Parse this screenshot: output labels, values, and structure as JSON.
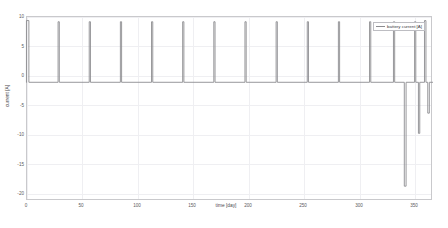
{
  "chart_data": {
    "type": "line",
    "title": "",
    "xlabel": "time [day]",
    "ylabel": "current [A]",
    "xlim": [
      0,
      365
    ],
    "ylim": [
      -20,
      11
    ],
    "xticks": [
      0,
      50,
      100,
      150,
      200,
      250,
      300,
      350
    ],
    "xticklabels": [
      "0",
      "50",
      "100",
      "150",
      "200",
      "250",
      "300",
      "350"
    ],
    "yticks": [
      10,
      5,
      0,
      -5,
      -10,
      -15,
      -20
    ],
    "yticklabels": [
      "10",
      "5",
      "0",
      "-5",
      "-10",
      "-15",
      "-20"
    ],
    "grid": true,
    "legend_position": "upper right",
    "series": [
      {
        "name": "battery current [A]",
        "color": "#8c8c90",
        "baseline": 0,
        "description": "Battery current vs time: flat 0 A baseline interrupted by narrow charge pulses to +10 A roughly every 28 days, a dense pulse burst at day 0, and deep negative discharge pulses near the end of the year.",
        "pulses": [
          {
            "day": 0.6,
            "value": 10.4,
            "width_days": 2.2
          },
          {
            "day": 28.5,
            "value": 10.2,
            "width_days": 1.1
          },
          {
            "day": 56.5,
            "value": 10.2,
            "width_days": 1.1
          },
          {
            "day": 84.5,
            "value": 10.2,
            "width_days": 1.1
          },
          {
            "day": 112.5,
            "value": 10.2,
            "width_days": 1.1
          },
          {
            "day": 140.5,
            "value": 10.2,
            "width_days": 1.1
          },
          {
            "day": 168.5,
            "value": 10.2,
            "width_days": 1.1
          },
          {
            "day": 196.5,
            "value": 10.2,
            "width_days": 1.1
          },
          {
            "day": 224.5,
            "value": 10.2,
            "width_days": 1.1
          },
          {
            "day": 252.5,
            "value": 10.2,
            "width_days": 1.1
          },
          {
            "day": 280.5,
            "value": 10.2,
            "width_days": 1.1
          },
          {
            "day": 308.5,
            "value": 10.2,
            "width_days": 1.1
          },
          {
            "day": 330.0,
            "value": 10.2,
            "width_days": 1.1
          },
          {
            "day": 340.0,
            "value": -17.5,
            "width_days": 1.6
          },
          {
            "day": 349.0,
            "value": 10.2,
            "width_days": 1.1
          },
          {
            "day": 352.5,
            "value": -8.6,
            "width_days": 1.2
          },
          {
            "day": 358.0,
            "value": 10.4,
            "width_days": 1.3
          },
          {
            "day": 361.0,
            "value": -5.2,
            "width_days": 1.4
          }
        ]
      }
    ]
  }
}
